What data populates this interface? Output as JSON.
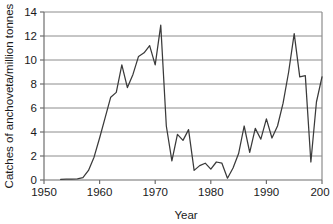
{
  "chart_data": {
    "type": "line",
    "title": "",
    "xlabel": "Year",
    "ylabel": "Catches of anchoveta/million tonnes",
    "xlim": [
      1950,
      2000
    ],
    "ylim": [
      0,
      14
    ],
    "xticks": [
      1950,
      1960,
      1970,
      1980,
      1990,
      2000
    ],
    "xtick_labels": [
      "1950",
      "1960",
      "1970",
      "1980",
      "1990",
      "200"
    ],
    "yticks": [
      0,
      2,
      4,
      6,
      8,
      10,
      12,
      14
    ],
    "ytick_labels": [
      "0",
      "2",
      "4",
      "6",
      "8",
      "10",
      "12",
      "14"
    ],
    "grid": "horizontal",
    "legend": "none",
    "line_color": "#3a3a3a",
    "grid_color": "#8c8c8c",
    "axis_color": "#6e6e6e",
    "series": [
      {
        "name": "Catches of anchoveta",
        "x": [
          1953,
          1954,
          1955,
          1956,
          1957,
          1958,
          1959,
          1960,
          1961,
          1962,
          1963,
          1964,
          1965,
          1966,
          1967,
          1968,
          1969,
          1970,
          1971,
          1972,
          1973,
          1974,
          1975,
          1976,
          1977,
          1978,
          1979,
          1980,
          1981,
          1982,
          1983,
          1984,
          1985,
          1986,
          1987,
          1988,
          1989,
          1990,
          1991,
          1992,
          1993,
          1994,
          1995,
          1996,
          1997,
          1998,
          1999,
          2000
        ],
        "values": [
          0.05,
          0.07,
          0.08,
          0.1,
          0.2,
          0.8,
          1.9,
          3.5,
          5.2,
          6.9,
          7.3,
          9.6,
          7.7,
          8.8,
          10.3,
          10.6,
          11.2,
          9.6,
          12.9,
          4.5,
          1.6,
          3.8,
          3.3,
          4.2,
          0.8,
          1.2,
          1.4,
          0.9,
          1.5,
          1.4,
          0.15,
          1.0,
          2.2,
          4.5,
          2.3,
          4.3,
          3.4,
          5.1,
          3.5,
          4.5,
          6.4,
          9.0,
          12.2,
          8.6,
          8.7,
          1.5,
          6.5,
          8.6
        ]
      }
    ]
  }
}
